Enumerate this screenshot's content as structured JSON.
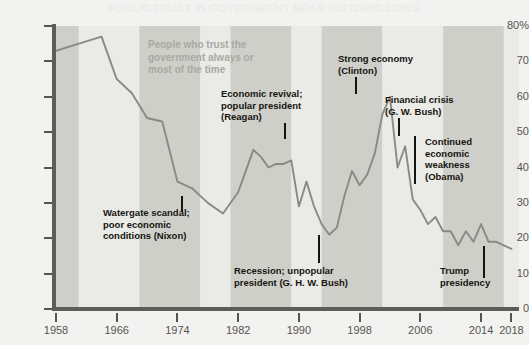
{
  "title_faint": "PUBLIC TRUST IN GOVERNMENT NEAR HISTORIC LOWS",
  "series_label": "People who trust the\ngovernment always or\nmost of the time",
  "colors": {
    "page_background": "#f2f2f0",
    "plot_background": "#e4e4e1",
    "band_dark": "#cfcfca",
    "band_light": "#eaeae7",
    "line": "#8a8a84",
    "axis": "#5c5c58",
    "annotation_text": "#15150f",
    "series_label_text": "#a9a9a2",
    "tick_text": "#55554f"
  },
  "axis": {
    "y_ticks": [
      "80%",
      "70",
      "60",
      "50",
      "40",
      "30",
      "20",
      "10",
      "0"
    ],
    "y_values": [
      80,
      70,
      60,
      50,
      40,
      30,
      20,
      10,
      0
    ],
    "x_ticks": [
      "1958",
      "1966",
      "1974",
      "1982",
      "1990",
      "1998",
      "2006",
      "2014",
      "2018"
    ],
    "x_values": [
      1958,
      1966,
      1974,
      1982,
      1990,
      1998,
      2006,
      2014,
      2018
    ]
  },
  "annotations": [
    {
      "name": "nixon",
      "text": "Watergate scandal;\npoor economic\nconditions (Nixon)",
      "x": 103,
      "y": 207,
      "leader": {
        "x": 181,
        "y": 196,
        "h": 16
      }
    },
    {
      "name": "reagan",
      "text": "Economic revival;\npopular president\n(Reagan)",
      "x": 221,
      "y": 88,
      "leader": {
        "x": 284,
        "y": 123,
        "h": 16
      }
    },
    {
      "name": "clinton",
      "text": "Strong economy\n(Clinton)",
      "x": 338,
      "y": 53,
      "leader": {
        "x": 355,
        "y": 77,
        "h": 17
      }
    },
    {
      "name": "gw-bush",
      "text": "Financial crisis\n(G. W. Bush)",
      "x": 385,
      "y": 94,
      "leader": {
        "x": 398,
        "y": 118,
        "h": 18
      }
    },
    {
      "name": "obama",
      "text": "Continued\neconomic\nweakness\n(Obama)",
      "x": 425,
      "y": 136,
      "leader": {
        "x": 414,
        "y": 136,
        "h": 48
      }
    },
    {
      "name": "ghw-bush",
      "text": "Recession; unpopular\npresident (G. H. W. Bush)",
      "x": 234,
      "y": 265,
      "leader": {
        "x": 318,
        "y": 235,
        "h": 28
      }
    },
    {
      "name": "trump",
      "text": "Trump\npresidency",
      "x": 440,
      "y": 265,
      "leader": {
        "x": 483,
        "y": 246,
        "h": 32
      }
    }
  ],
  "presidential_bands": [
    {
      "start": 1958,
      "end": 1961,
      "shade": "dark"
    },
    {
      "start": 1961,
      "end": 1969,
      "shade": "light"
    },
    {
      "start": 1969,
      "end": 1977,
      "shade": "dark"
    },
    {
      "start": 1977,
      "end": 1981,
      "shade": "light"
    },
    {
      "start": 1981,
      "end": 1989,
      "shade": "dark"
    },
    {
      "start": 1989,
      "end": 1993,
      "shade": "light"
    },
    {
      "start": 1993,
      "end": 2001,
      "shade": "dark"
    },
    {
      "start": 2001,
      "end": 2009,
      "shade": "light"
    },
    {
      "start": 2009,
      "end": 2017,
      "shade": "dark"
    },
    {
      "start": 2017,
      "end": 2019,
      "shade": "light"
    }
  ],
  "chart_data": {
    "type": "line",
    "xlabel": "",
    "ylabel": "",
    "ylim": [
      0,
      80
    ],
    "xlim": [
      1958,
      2019
    ],
    "grid": false,
    "legend": "none",
    "series": [
      {
        "name": "People who trust the government always or most of the time",
        "x": [
          1958,
          1964,
          1966,
          1968,
          1970,
          1972,
          1974,
          1976,
          1978,
          1980,
          1982,
          1984,
          1985,
          1986,
          1987,
          1988,
          1989,
          1990,
          1991,
          1992,
          1993,
          1994,
          1995,
          1996,
          1997,
          1998,
          1999,
          2000,
          2001,
          2002,
          2003,
          2004,
          2005,
          2006,
          2007,
          2008,
          2009,
          2010,
          2011,
          2012,
          2013,
          2014,
          2015,
          2016,
          2017,
          2018
        ],
        "y": [
          73,
          77,
          65,
          61,
          54,
          53,
          36,
          34,
          30,
          27,
          33,
          45,
          43,
          40,
          41,
          41,
          42,
          29,
          36,
          29,
          24,
          21,
          23,
          32,
          39,
          35,
          38,
          44,
          55,
          60,
          40,
          46,
          31,
          28,
          24,
          26,
          22,
          22,
          18,
          22,
          19,
          24,
          19,
          19,
          18,
          17
        ]
      }
    ]
  }
}
